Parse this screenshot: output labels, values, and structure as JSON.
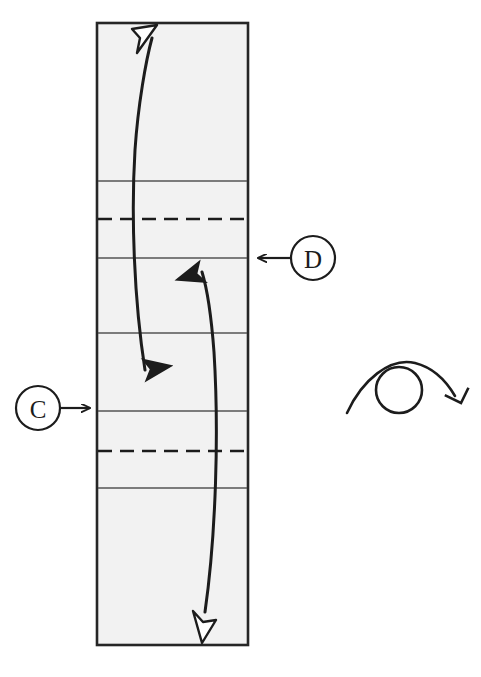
{
  "figure": {
    "background_color": "#ffffff",
    "body": {
      "name": "layered-column",
      "fill_color": "#f2f2f2",
      "stroke_color": "#262626",
      "stroke_width": 2.6,
      "x": 97,
      "y": 23,
      "width": 151,
      "height": 622
    },
    "interior_lines": [
      {
        "id": "line-1",
        "style": "solid",
        "y": 181,
        "color": "#555555",
        "width": 1.5
      },
      {
        "id": "line-2",
        "style": "dashed",
        "y": 219,
        "color": "#1c1c1c",
        "width": 2.6
      },
      {
        "id": "line-3",
        "style": "solid",
        "y": 258,
        "color": "#555555",
        "width": 1.5
      },
      {
        "id": "line-4",
        "style": "solid",
        "y": 333,
        "color": "#555555",
        "width": 1.5
      },
      {
        "id": "line-5",
        "style": "solid",
        "y": 411,
        "color": "#555555",
        "width": 1.5
      },
      {
        "id": "line-6",
        "style": "dashed",
        "y": 451,
        "color": "#1c1c1c",
        "width": 2.6
      },
      {
        "id": "line-7",
        "style": "solid",
        "y": 488,
        "color": "#555555",
        "width": 1.5
      }
    ],
    "dash_pattern": "14 8",
    "flow_arrows": [
      {
        "id": "left-flow-arrow",
        "path": "M 153 408 C 131 345 127 240 136 140 C 141 88 147 50 152 31",
        "head_start": "open-triangle-up",
        "head_end": "solid-up",
        "color": "#1c1c1c",
        "width": 3.0
      },
      {
        "id": "right-flow-arrow",
        "path": "M 206 620 C 216 540 219 430 214 350 C 209 305 202 275 197 261",
        "head_start": "open-triangle-down",
        "head_end": "solid-up",
        "color": "#1c1c1c",
        "width": 3.0
      }
    ],
    "callouts": [
      {
        "id": "callout-c",
        "label": "C",
        "circle": {
          "cx": 38,
          "cy": 408,
          "r": 22
        },
        "arrow": {
          "from_x": 61,
          "to_x": 94,
          "y": 408,
          "direction": "right"
        },
        "stroke_color": "#1c1c1c"
      },
      {
        "id": "callout-d",
        "label": "D",
        "circle": {
          "cx": 313,
          "cy": 258,
          "r": 22
        },
        "arrow": {
          "from_x": 290,
          "to_x": 254,
          "y": 258,
          "direction": "left"
        },
        "stroke_color": "#1c1c1c"
      }
    ],
    "rotation_symbol": {
      "id": "rotation-indicator",
      "circle": {
        "cx": 399,
        "cy": 390,
        "r": 23
      },
      "arc_path": "M 348 412 C 364 378 392 358 416 364 C 437 369 450 385 458 399",
      "arrow_tip": {
        "x": 460,
        "y": 402
      },
      "color": "#1c1c1c",
      "width": 2.6
    }
  }
}
